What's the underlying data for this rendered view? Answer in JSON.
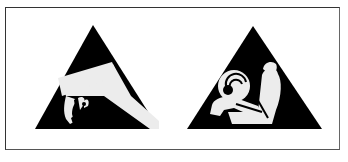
{
  "figure": {
    "panels": [
      {
        "name": "esd-warning",
        "symbol": "electrostatic-discharge-hand-icon",
        "color": "#000000"
      },
      {
        "name": "airbag-warning",
        "symbol": "airbag-seated-person-icon",
        "color": "#000000"
      }
    ],
    "colors": {
      "triangle": "#000000",
      "symbol": "#ececec",
      "frame": "#333333",
      "background": "#ffffff"
    }
  }
}
